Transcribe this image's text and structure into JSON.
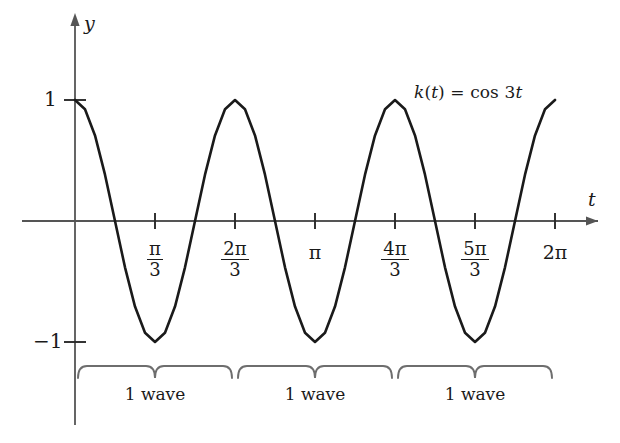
{
  "figure": {
    "function_label_plain": "k(t) = cos 3t",
    "function_label_parts": {
      "k": "k",
      "paren_open": "(",
      "t1": "t",
      "paren_close": ")",
      "equals": " = cos 3",
      "t2": "t"
    },
    "x_axis_name": "t",
    "y_axis_name": "y",
    "curve_color": "#1a1a1a",
    "axis_color": "#555555",
    "brace_color": "#6e6e6e"
  },
  "y_ticks": [
    {
      "label": "1",
      "value": 1
    },
    {
      "label": "−1",
      "value": -1
    }
  ],
  "x_ticks": [
    {
      "label": "π/3",
      "num": "π",
      "den": "3",
      "kind": "fraction",
      "value": 1.0471975512
    },
    {
      "label": "2π/3",
      "num": "2π",
      "den": "3",
      "kind": "fraction",
      "value": 2.0943951024
    },
    {
      "label": "π",
      "kind": "plain",
      "value": 3.1415926536
    },
    {
      "label": "4π/3",
      "num": "4π",
      "den": "3",
      "kind": "fraction",
      "value": 4.1887902048
    },
    {
      "label": "5π/3",
      "num": "5π",
      "den": "3",
      "kind": "fraction",
      "value": 5.235987756
    },
    {
      "label": "2π",
      "kind": "plain",
      "value": 6.2831853072
    }
  ],
  "braces": [
    {
      "label": "1 wave",
      "start": 0.0,
      "end": 2.0943951024
    },
    {
      "label": "1 wave",
      "start": 2.0943951024,
      "end": 4.1887902048
    },
    {
      "label": "1 wave",
      "start": 4.1887902048,
      "end": 6.2831853072
    }
  ],
  "chart_data": {
    "type": "line",
    "title": "",
    "subtitle": "",
    "xlabel": "t",
    "ylabel": "y",
    "expression": "k(t) = cos 3t",
    "amplitude": 1,
    "period": 2.0943951024,
    "frequency_multiplier": 3,
    "xlim": [
      0,
      6.2831853072
    ],
    "ylim": [
      -1,
      1
    ],
    "grid": false,
    "legend": "none",
    "annotations": [
      {
        "text": "k(t) = cos 3t",
        "x": 4.6,
        "y": 0.93
      },
      {
        "text": "1 wave",
        "x": 1.047,
        "y": -1.45
      },
      {
        "text": "1 wave",
        "x": 3.142,
        "y": -1.45
      },
      {
        "text": "1 wave",
        "x": 5.236,
        "y": -1.45
      }
    ],
    "x_tick_labels": [
      "π/3",
      "2π/3",
      "π",
      "4π/3",
      "5π/3",
      "2π"
    ],
    "x_tick_values": [
      1.0471975512,
      2.0943951024,
      3.1415926536,
      4.1887902048,
      5.235987756,
      6.2831853072
    ],
    "y_tick_labels": [
      "1",
      "−1"
    ],
    "y_tick_values": [
      1,
      -1
    ],
    "series": [
      {
        "name": "k(t) = cos 3t",
        "x": [
          0,
          0.1309,
          0.2618,
          0.3927,
          0.5236,
          0.6545,
          0.7854,
          0.9163,
          1.0472,
          1.1781,
          1.309,
          1.4399,
          1.5708,
          1.7017,
          1.8326,
          1.9635,
          2.0944,
          2.2253,
          2.3562,
          2.4871,
          2.618,
          2.7489,
          2.8798,
          3.0107,
          3.1416,
          3.2725,
          3.4034,
          3.5343,
          3.6652,
          3.7961,
          3.927,
          4.0579,
          4.1888,
          4.3197,
          4.4506,
          4.5815,
          4.7124,
          4.8433,
          4.9742,
          5.1051,
          5.236,
          5.3669,
          5.4978,
          5.6287,
          5.7596,
          5.8905,
          6.0214,
          6.1523,
          6.2832
        ],
        "y": [
          1.0,
          0.9239,
          0.7071,
          0.3827,
          0.0,
          -0.3827,
          -0.7071,
          -0.9239,
          -1.0,
          -0.9239,
          -0.7071,
          -0.3827,
          0.0,
          0.3827,
          0.7071,
          0.9239,
          1.0,
          0.9239,
          0.7071,
          0.3827,
          0.0,
          -0.3827,
          -0.7071,
          -0.9239,
          -1.0,
          -0.9239,
          -0.7071,
          -0.3827,
          0.0,
          0.3827,
          0.7071,
          0.9239,
          1.0,
          0.9239,
          0.7071,
          0.3827,
          0.0,
          -0.3827,
          -0.7071,
          -0.9239,
          -1.0,
          -0.9239,
          -0.7071,
          -0.3827,
          0.0,
          0.3827,
          0.7071,
          0.9239,
          1.0
        ]
      }
    ]
  }
}
